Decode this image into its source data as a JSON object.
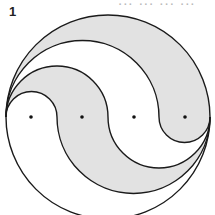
{
  "figure": {
    "label": "1",
    "clipped_header_text": "... ... ... ..."
  },
  "diagram": {
    "type": "nested yin-yang circle division",
    "outer_circle": {
      "cx": 108,
      "cy": 117,
      "r": 102
    },
    "dots": [
      {
        "x": 31,
        "y": 117
      },
      {
        "x": 82,
        "y": 117
      },
      {
        "x": 134,
        "y": 117
      },
      {
        "x": 185,
        "y": 117
      }
    ],
    "regions": 4,
    "colors": {
      "shade": "#e2e2e2",
      "line": "#1a1a1a",
      "background": "#ffffff",
      "dot": "#111111"
    }
  }
}
